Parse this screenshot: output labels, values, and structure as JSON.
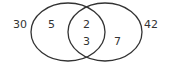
{
  "diagram": {
    "type": "venn",
    "outside_labels": {
      "left": "30",
      "right": "42"
    },
    "regions": {
      "left_only": "5",
      "intersection_top": "2",
      "intersection_bottom": "3",
      "right_only": "7"
    },
    "colors": {
      "stroke": "#333333",
      "background": "#ffffff"
    }
  }
}
